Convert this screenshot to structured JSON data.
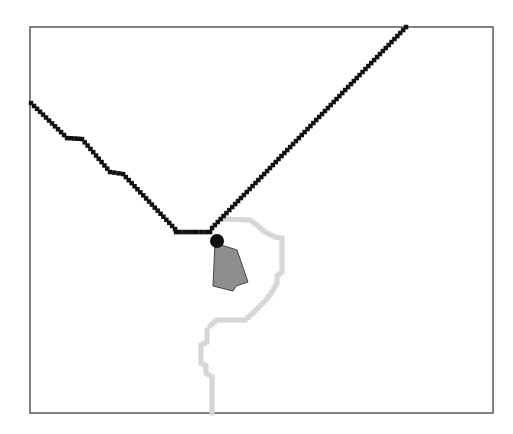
{
  "canvas": {
    "width": 513,
    "height": 434,
    "background": "#ffffff"
  },
  "frame": {
    "x": 30,
    "y": 27,
    "width": 463,
    "height": 386,
    "stroke": "#5a5a5a",
    "stroke_width": 1.5
  },
  "black_path": {
    "color": "#111111",
    "step": 4.2,
    "square_size": 4.5,
    "points": [
      [
        31,
        103
      ],
      [
        67,
        138
      ],
      [
        82,
        139
      ],
      [
        110,
        172
      ],
      [
        123,
        174
      ],
      [
        175,
        229
      ],
      [
        176,
        232
      ],
      [
        210,
        232
      ],
      [
        212,
        228
      ],
      [
        406,
        27
      ]
    ]
  },
  "gray_path": {
    "color": "#d6d6d6",
    "width": 5,
    "points": [
      [
        222,
        219
      ],
      [
        250,
        220
      ],
      [
        258,
        226
      ],
      [
        265,
        232
      ],
      [
        275,
        237
      ],
      [
        282,
        238
      ],
      [
        282,
        272
      ],
      [
        277,
        276
      ],
      [
        277,
        283
      ],
      [
        272,
        292
      ],
      [
        266,
        300
      ],
      [
        258,
        308
      ],
      [
        251,
        315
      ],
      [
        245,
        320
      ],
      [
        217,
        320
      ],
      [
        210,
        326
      ],
      [
        207,
        330
      ],
      [
        207,
        342
      ],
      [
        201,
        345
      ],
      [
        201,
        363
      ],
      [
        206,
        366
      ],
      [
        206,
        373
      ],
      [
        212,
        377
      ],
      [
        212,
        413
      ]
    ]
  },
  "obstacle_polygon": {
    "fill": "#8e8e8e",
    "stroke": "#444444",
    "points": [
      [
        215,
        243
      ],
      [
        237,
        250
      ],
      [
        248,
        282
      ],
      [
        236,
        286
      ],
      [
        233,
        291
      ],
      [
        213,
        286
      ]
    ]
  },
  "marker": {
    "cx": 217,
    "cy": 241,
    "r": 7,
    "fill": "#0d0d0d"
  }
}
